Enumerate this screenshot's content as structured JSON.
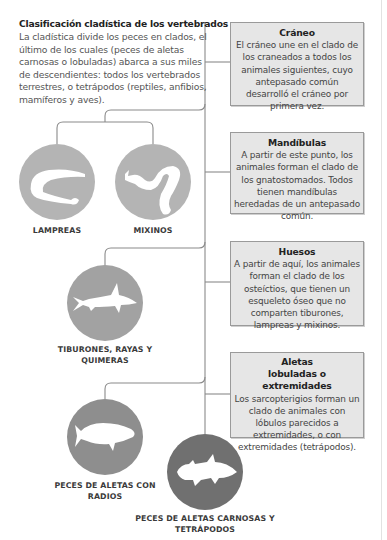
{
  "intro": {
    "title": "Clasificación cladística de los vertebrados",
    "text": "La cladística divide los peces en clados, el último de los cuales (peces de aletas carnosas o lobuladas) abarca a sus miles de descendientes: todos los vertebrados terrestres, o tetrápodos (reptiles, anfibios, mamíferos y aves)."
  },
  "boxes": [
    {
      "title": "Cráneo",
      "text": "El cráneo une en el clado de los craneados a todos los animales siguientes, cuyo antepasado común desarrolló el cráneo por primera vez."
    },
    {
      "title": "Mandíbulas",
      "text": "A partir de este punto, los animales forman el clado de los gnatostomados. Todos tienen mandíbulas heredadas de un antepasado común."
    },
    {
      "title": "Huesos",
      "text": "A partir de aquí, los animales forman el clado de los osteíctios, que tienen un esqueleto óseo que no comparten tiburones, lampreas y mixinos."
    },
    {
      "title": "Aletas lobuladas o extremidades",
      "text": "Los sarcopterigios forman un clado de animales con lóbulos parecidos a extremidades, o con extremidades (tetrápodos)."
    }
  ],
  "groups": [
    {
      "label": "LAMPREAS",
      "icon": "lamprey-icon",
      "color": "#b4b4b4"
    },
    {
      "label": "MIXINOS",
      "icon": "hagfish-icon",
      "color": "#b4b4b4"
    },
    {
      "label": "TIBURONES, RAYAS Y QUIMERAS",
      "icon": "shark-icon",
      "color": "#a2a2a2"
    },
    {
      "label": "PECES DE ALETAS CON RADIOS",
      "icon": "ray-finned-fish-icon",
      "color": "#8e8e8e"
    },
    {
      "label": "PECES DE ALETAS CARNOSAS Y TETRÁPODOS",
      "icon": "coelacanth-icon",
      "color": "#707070"
    }
  ],
  "colors": {
    "line": "#8a8a8a",
    "box_fill": "#e6e6e6",
    "box_border": "#9a9a9a"
  }
}
